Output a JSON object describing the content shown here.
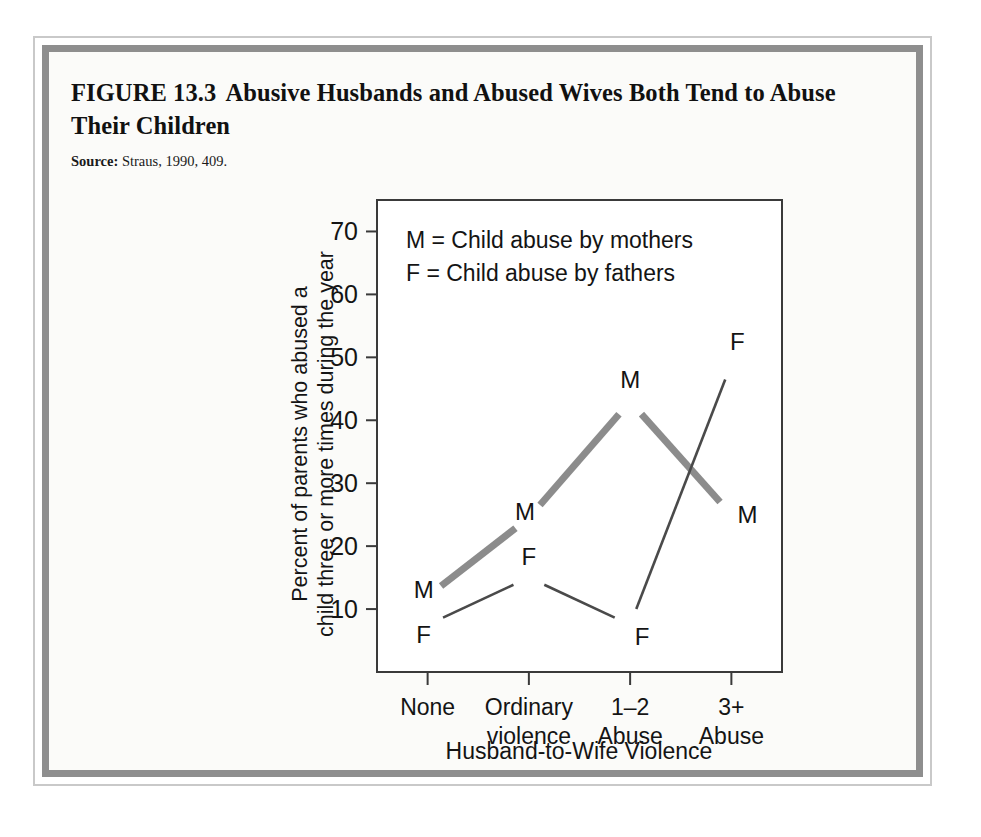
{
  "figure": {
    "number": "FIGURE 13.3",
    "title": "Abusive Husbands and Abused Wives Both Tend to Abuse Their Children",
    "source_label": "Source:",
    "source_text": "Straus, 1990, 409."
  },
  "chart_data": {
    "type": "line",
    "title": "Abusive Husbands and Abused Wives Both Tend to Abuse Their Children",
    "xlabel": "Husband-to-Wife Violence",
    "ylabel": "Percent of parents who abused a child three or more times during the year",
    "ylabel_line1": "Percent of parents who abused a",
    "ylabel_line2": "child three or more times during the year",
    "categories": [
      "None",
      "Ordinary violence",
      "1–2 Abuse",
      "3+ Abuse"
    ],
    "category_lines": [
      [
        "None"
      ],
      [
        "Ordinary",
        "violence"
      ],
      [
        "1–2",
        "Abuse"
      ],
      [
        "3+",
        "Abuse"
      ]
    ],
    "ylim": [
      0,
      75
    ],
    "yticks": [
      10,
      20,
      30,
      40,
      50,
      60,
      70
    ],
    "ytick_labels": [
      "10",
      "20",
      "30",
      "40",
      "50",
      "60",
      "70"
    ],
    "grid": false,
    "legend_position": "inside-top-left",
    "series": [
      {
        "name": "M",
        "legend": "M = Child abuse by mothers",
        "marker_letter": "M",
        "values": [
          12,
          24.5,
          43,
          25
        ],
        "color": "#8c8c8c",
        "width": 7
      },
      {
        "name": "F",
        "legend": "F = Child abuse by fathers",
        "marker_letter": "F",
        "values": [
          7.5,
          15,
          7.5,
          49
        ],
        "color": "#4a4a4a",
        "width": 2.6
      }
    ],
    "legend_entries": [
      "M = Child abuse by mothers",
      "F = Child abuse by fathers"
    ],
    "point_labels": [
      {
        "series": "M",
        "category": "None",
        "text": "M",
        "value": 12
      },
      {
        "series": "F",
        "category": "None",
        "text": "F",
        "value": 7.5
      },
      {
        "series": "M",
        "category": "Ordinary violence",
        "text": "M",
        "value": 24.5
      },
      {
        "series": "F",
        "category": "Ordinary violence",
        "text": "F",
        "value": 15
      },
      {
        "series": "M",
        "category": "1–2 Abuse",
        "text": "M",
        "value": 43
      },
      {
        "series": "F",
        "category": "1–2 Abuse",
        "text": "F",
        "value": 7.5
      },
      {
        "series": "M",
        "category": "3+ Abuse",
        "text": "M",
        "value": 25
      },
      {
        "series": "F",
        "category": "3+ Abuse",
        "text": "F",
        "value": 49
      }
    ]
  }
}
